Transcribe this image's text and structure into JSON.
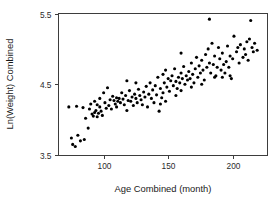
{
  "chart_data": {
    "type": "scatter",
    "title": "",
    "xlabel": "Age Combined (month)",
    "ylabel": "Ln(Weight) Combined",
    "xlim": [
      65,
      227
    ],
    "ylim": [
      3.5,
      5.5
    ],
    "xticks": [
      100,
      150,
      200
    ],
    "xtick_labels": [
      "100",
      "150",
      "200"
    ],
    "yticks": [
      3.5,
      4.5,
      5.5
    ],
    "ytick_labels": [
      "3.5",
      "4.5",
      "5.5"
    ],
    "grid": false,
    "legend": null,
    "marker": "filled-circle",
    "marker_color": "#000000",
    "marker_size_px": 3.1,
    "frame_color": "#3d3d3d",
    "background_color": "#ffffff",
    "n_points": 152,
    "series": [
      {
        "name": "Age vs Ln(Weight)",
        "points": [
          [
            73,
            4.18
          ],
          [
            75,
            3.74
          ],
          [
            76,
            3.65
          ],
          [
            78,
            3.62
          ],
          [
            79,
            4.19
          ],
          [
            80,
            3.78
          ],
          [
            82,
            3.7
          ],
          [
            84,
            4.17
          ],
          [
            85,
            3.72
          ],
          [
            86,
            4.02
          ],
          [
            88,
            3.88
          ],
          [
            89,
            4.15
          ],
          [
            90,
            4.22
          ],
          [
            91,
            4.08
          ],
          [
            92,
            4.05
          ],
          [
            93,
            4.1
          ],
          [
            93,
            4.26
          ],
          [
            94,
            4.13
          ],
          [
            95,
            4.21
          ],
          [
            95,
            4.04
          ],
          [
            96,
            4.09
          ],
          [
            97,
            4.18
          ],
          [
            97,
            4.3
          ],
          [
            98,
            4.12
          ],
          [
            99,
            4.06
          ],
          [
            100,
            4.38
          ],
          [
            101,
            4.24
          ],
          [
            102,
            4.16
          ],
          [
            103,
            4.45
          ],
          [
            104,
            4.2
          ],
          [
            105,
            4.28
          ],
          [
            106,
            4.15
          ],
          [
            107,
            4.33
          ],
          [
            108,
            4.27
          ],
          [
            109,
            4.22
          ],
          [
            110,
            4.31
          ],
          [
            110,
            4.18
          ],
          [
            111,
            4.26
          ],
          [
            112,
            4.3
          ],
          [
            113,
            4.24
          ],
          [
            114,
            4.38
          ],
          [
            115,
            4.29
          ],
          [
            116,
            4.21
          ],
          [
            117,
            4.34
          ],
          [
            118,
            4.55
          ],
          [
            118,
            4.13
          ],
          [
            119,
            4.27
          ],
          [
            120,
            4.41
          ],
          [
            121,
            4.26
          ],
          [
            122,
            4.32
          ],
          [
            123,
            4.2
          ],
          [
            124,
            4.36
          ],
          [
            125,
            4.3
          ],
          [
            126,
            4.24
          ],
          [
            127,
            4.43
          ],
          [
            128,
            4.34
          ],
          [
            129,
            4.28
          ],
          [
            130,
            4.21
          ],
          [
            131,
            4.39
          ],
          [
            132,
            4.32
          ],
          [
            133,
            4.47
          ],
          [
            135,
            4.36
          ],
          [
            136,
            4.52
          ],
          [
            137,
            4.3
          ],
          [
            138,
            4.42
          ],
          [
            139,
            4.24
          ],
          [
            140,
            4.48
          ],
          [
            141,
            4.35
          ],
          [
            142,
            4.6
          ],
          [
            143,
            4.12
          ],
          [
            144,
            4.44
          ],
          [
            145,
            4.31
          ],
          [
            146,
            4.64
          ],
          [
            146,
            4.38
          ],
          [
            147,
            4.52
          ],
          [
            148,
            4.26
          ],
          [
            148,
            4.7
          ],
          [
            149,
            4.46
          ],
          [
            150,
            4.58
          ],
          [
            151,
            4.4
          ],
          [
            152,
            4.55
          ],
          [
            153,
            4.62
          ],
          [
            154,
            4.48
          ],
          [
            155,
            4.72
          ],
          [
            156,
            4.54
          ],
          [
            157,
            4.44
          ],
          [
            158,
            4.6
          ],
          [
            159,
            4.52
          ],
          [
            160,
            4.66
          ],
          [
            160,
            4.41
          ],
          [
            161,
            4.58
          ],
          [
            162,
            4.75
          ],
          [
            163,
            4.5
          ],
          [
            164,
            4.62
          ],
          [
            165,
            4.56
          ],
          [
            166,
            4.68
          ],
          [
            167,
            4.58
          ],
          [
            168,
            4.8
          ],
          [
            169,
            4.64
          ],
          [
            170,
            4.52
          ],
          [
            171,
            4.72
          ],
          [
            172,
            4.88
          ],
          [
            173,
            4.6
          ],
          [
            174,
            4.76
          ],
          [
            175,
            4.66
          ],
          [
            176,
            4.84
          ],
          [
            177,
            4.7
          ],
          [
            178,
            4.56
          ],
          [
            179,
            4.92
          ],
          [
            180,
            4.74
          ],
          [
            181,
            5.0
          ],
          [
            182,
            5.42
          ],
          [
            182,
            4.8
          ],
          [
            183,
            4.66
          ],
          [
            184,
            5.08
          ],
          [
            185,
            4.78
          ],
          [
            186,
            4.9
          ],
          [
            187,
            4.62
          ],
          [
            188,
            4.74
          ],
          [
            189,
            5.02
          ],
          [
            190,
            4.86
          ],
          [
            191,
            4.7
          ],
          [
            192,
            4.94
          ],
          [
            193,
            4.78
          ],
          [
            194,
            4.66
          ],
          [
            195,
            4.82
          ],
          [
            196,
            5.04
          ],
          [
            197,
            4.74
          ],
          [
            198,
            4.9
          ],
          [
            199,
            4.58
          ],
          [
            200,
            4.86
          ],
          [
            201,
            5.18
          ],
          [
            203,
            4.96
          ],
          [
            205,
            4.8
          ],
          [
            206,
            5.06
          ],
          [
            208,
            4.88
          ],
          [
            209,
            5.0
          ],
          [
            210,
            4.92
          ],
          [
            211,
            5.1
          ],
          [
            212,
            4.84
          ],
          [
            213,
            5.14
          ],
          [
            214,
            5.4
          ],
          [
            215,
            5.02
          ],
          [
            216,
            4.96
          ],
          [
            217,
            5.08
          ],
          [
            219,
            4.98
          ],
          [
            125,
            4.52
          ],
          [
            134,
            4.18
          ],
          [
            144,
            4.22
          ],
          [
            156,
            4.34
          ],
          [
            168,
            4.46
          ],
          [
            176,
            4.5
          ],
          [
            186,
            4.6
          ],
          [
            192,
            4.6
          ],
          [
            198,
            4.62
          ],
          [
            204,
            5.02
          ],
          [
            160,
            4.94
          ]
        ]
      }
    ]
  }
}
